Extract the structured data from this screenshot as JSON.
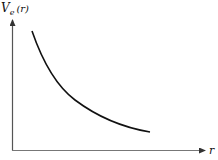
{
  "figure": {
    "y_axis_label": {
      "symbol": "V",
      "subscript": "e",
      "argument": "(r)"
    },
    "x_axis_label": "r",
    "curve": {
      "description": "monotonically decreasing convex curve",
      "shape": "decay"
    },
    "colors": {
      "axes": "#555555",
      "curve": "#111111",
      "background": "#ffffff"
    }
  }
}
